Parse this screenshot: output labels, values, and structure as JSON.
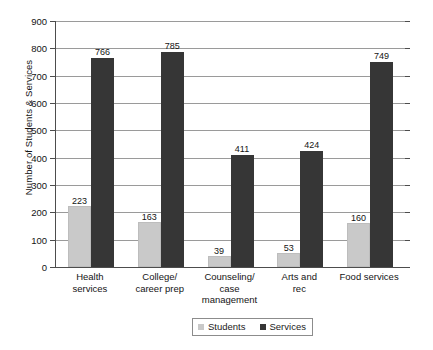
{
  "chart_data": {
    "type": "bar",
    "title": "",
    "xlabel": "",
    "ylabel": "Number of Students & Services",
    "ylim": [
      0,
      900
    ],
    "ytick_step": 100,
    "yticks": [
      0,
      100,
      200,
      300,
      400,
      500,
      600,
      700,
      800,
      900
    ],
    "grid": true,
    "legend_position": "bottom-center",
    "categories": [
      "Health services",
      "College/ career prep",
      "Counseling/ case management",
      "Arts and rec",
      "Food services"
    ],
    "category_lines": [
      [
        "Health",
        "services"
      ],
      [
        "College/",
        "career prep"
      ],
      [
        "Counseling/",
        "case",
        "management"
      ],
      [
        "Arts and",
        "rec"
      ],
      [
        "Food services"
      ]
    ],
    "series": [
      {
        "name": "Students",
        "color": "#c9c9c9",
        "values": [
          223,
          163,
          39,
          53,
          160
        ]
      },
      {
        "name": "Services",
        "color": "#363636",
        "values": [
          766,
          785,
          411,
          424,
          749
        ]
      }
    ]
  },
  "legend": {
    "entries": [
      {
        "label": "Students"
      },
      {
        "label": "Services"
      }
    ]
  }
}
